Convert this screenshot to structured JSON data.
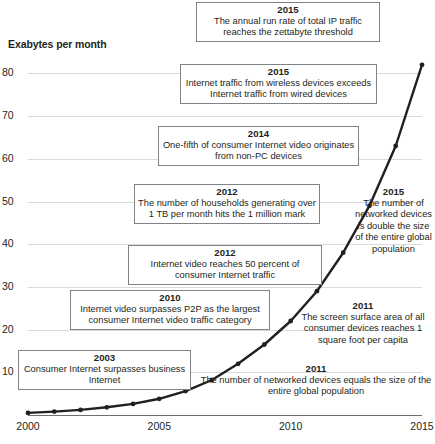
{
  "chart_data": {
    "type": "line",
    "title": "",
    "subtitle": "",
    "ylabel": "Exabytes per month",
    "xlabel": "",
    "ylim": [
      0,
      85
    ],
    "xlim": [
      2000,
      2015
    ],
    "yticks": [
      "10",
      "20",
      "30",
      "40",
      "50",
      "60",
      "70",
      "80"
    ],
    "ytick_values": [
      10,
      20,
      30,
      40,
      50,
      60,
      70,
      80
    ],
    "xticks": [
      "2000",
      "2005",
      "2010",
      "2015"
    ],
    "xtick_values": [
      2000,
      2005,
      2010,
      2015
    ],
    "grid": "horizontal",
    "legend": "none",
    "markers": "filled-circle",
    "line_color": "#231f20",
    "grid_color": "#d9dadb",
    "axis_color": "#6d6e71",
    "series": [
      {
        "name": "Global IP traffic",
        "x": [
          2000,
          2001,
          2002,
          2003,
          2004,
          2005,
          2006,
          2007,
          2008,
          2009,
          2010,
          2011,
          2012,
          2013,
          2014,
          2015
        ],
        "values": [
          0.5,
          0.8,
          1.2,
          1.8,
          2.6,
          3.8,
          5.6,
          8.2,
          12.0,
          16.5,
          22.0,
          29.0,
          38.0,
          49.0,
          63.0,
          82.0
        ]
      }
    ]
  },
  "annotations": [
    {
      "id": "zettabyte-threshold",
      "year": "2015",
      "body": "The annual run rate of total IP traffic reaches the zettabyte threshold",
      "boxed": true
    },
    {
      "id": "wireless-exceeds-wired",
      "year": "2015",
      "body": "Internet traffic from wireless devices exceeds Internet traffic from wired devices",
      "boxed": true
    },
    {
      "id": "non-pc-video",
      "year": "2014",
      "body": "One-fifth of consumer Internet video originates from non-PC devices",
      "boxed": true
    },
    {
      "id": "households-1tb",
      "year": "2012",
      "body": "The number of households generating over 1 TB per month hits the 1 million mark",
      "boxed": true
    },
    {
      "id": "video-50-percent",
      "year": "2012",
      "body": "Internet video reaches 50 percent of consumer Internet traffic",
      "boxed": true
    },
    {
      "id": "video-surpasses-p2p",
      "year": "2010",
      "body": "Internet video surpasses P2P as the largest consumer Internet video traffic category",
      "boxed": true
    },
    {
      "id": "consumer-surpasses-business",
      "year": "2003",
      "body": "Consumer Internet surpasses business Internet",
      "boxed": true
    },
    {
      "id": "devices-double-population",
      "year": "2015",
      "body": "The number of networked devices is double the size of the entire global population",
      "boxed": false
    },
    {
      "id": "screen-surface-area",
      "year": "2011",
      "body": "The screen surface area of all consumer devices reaches 1 square foot per capita",
      "boxed": false
    },
    {
      "id": "devices-equal-population",
      "year": "2011",
      "body": "The number of networked devices equals the size of the entire global population",
      "boxed": false
    }
  ]
}
